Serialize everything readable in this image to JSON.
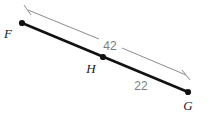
{
  "figure": {
    "background_color": "#ffffff",
    "segment_color": "#111111",
    "dimension_color": "#8c8c8c",
    "label_color": "#1a1a1a",
    "dimension_label_color": "#7d7d7d",
    "points": [
      {
        "id": "F",
        "label": "F",
        "x": 22,
        "y": 23,
        "label_x": 8,
        "label_y": 38
      },
      {
        "id": "H",
        "label": "H",
        "x": 103,
        "y": 57,
        "label_x": 87,
        "label_y": 73
      },
      {
        "id": "G",
        "label": "G",
        "x": 188,
        "y": 92,
        "label_x": 182,
        "label_y": 110
      }
    ],
    "segments": [
      {
        "id": "FG",
        "from": "F",
        "to": "G",
        "stroke_width": 2.6
      }
    ],
    "dimensions": [
      {
        "id": "dim-42",
        "value": "42",
        "from": "F",
        "to": "G",
        "x1": 28,
        "y1": 10,
        "x2": 186,
        "y2": 75,
        "label_x": 103,
        "label_y": 50,
        "tick1_x1": 24,
        "tick1_y1": 5,
        "tick1_x2": 31,
        "tick1_y2": 15,
        "tick2_x1": 182,
        "tick2_y1": 70,
        "tick2_x2": 190,
        "tick2_y2": 80
      },
      {
        "id": "dim-22",
        "value": "22",
        "from": "H",
        "to": "G",
        "label_x": 134,
        "label_y": 90
      }
    ]
  }
}
